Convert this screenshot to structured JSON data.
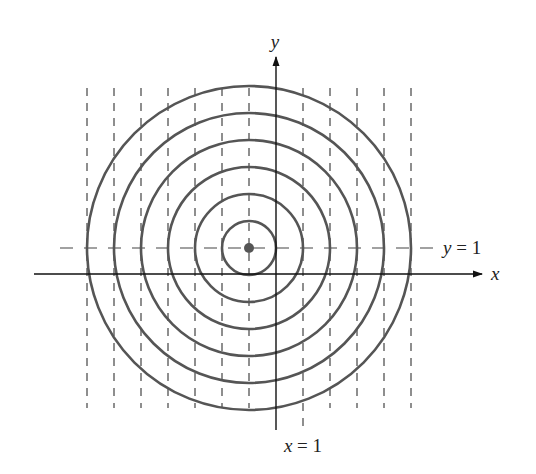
{
  "figure": {
    "labels": {
      "y_axis": "y",
      "x_axis": "x",
      "y_eq": "y = 1",
      "x_eq": "x = 1"
    },
    "center": {
      "x": -1,
      "y": 1
    },
    "circle_radii": [
      1,
      2,
      3,
      4,
      5,
      6
    ],
    "vertical_dashed_lines_x": [
      -7,
      -6,
      -5,
      -4,
      -3,
      -2,
      -1,
      1,
      2,
      3,
      4,
      5
    ],
    "horizontal_dashed_line_y": 1,
    "colors": {
      "curves": "#555555",
      "axes": "#111111",
      "dashed": "#444444",
      "center_dot": "#555555"
    }
  }
}
